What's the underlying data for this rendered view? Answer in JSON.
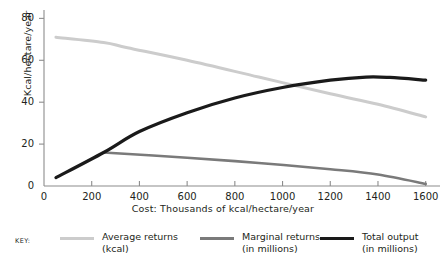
{
  "chart_data": {
    "type": "line",
    "title": "",
    "xlabel": "Cost:  Thousands of kcal/hectare/year",
    "ylabel": "Kcal/hectare/year",
    "xlim": [
      0,
      1660
    ],
    "ylim": [
      0,
      84
    ],
    "grid": false,
    "legend_position": "below",
    "xticks": [
      0,
      200,
      400,
      600,
      800,
      1000,
      1200,
      1400,
      1600
    ],
    "yticks": [
      0,
      20,
      40,
      60,
      80
    ],
    "series": [
      {
        "name": "Average returns (kcal)",
        "color": "#cccccc",
        "width": 3,
        "x": [
          50,
          250,
          350,
          600,
          900,
          1200,
          1400,
          1600
        ],
        "y": [
          71,
          68.5,
          66,
          60,
          52,
          44,
          39,
          33
        ]
      },
      {
        "name": "Marginal returns (in millions)",
        "color": "#7a7a7a",
        "width": 2.6,
        "x": [
          250,
          600,
          900,
          1200,
          1400,
          1600
        ],
        "y": [
          16,
          13.5,
          11,
          8,
          5.5,
          1
        ]
      },
      {
        "name": "Total output (in millions)",
        "color": "#1a1a1a",
        "width": 3.2,
        "x": [
          50,
          250,
          400,
          600,
          800,
          1000,
          1200,
          1350,
          1450,
          1600
        ],
        "y": [
          4,
          16,
          26,
          35,
          42,
          47,
          50.5,
          52,
          51.8,
          50.5
        ]
      }
    ]
  },
  "axes": {
    "ylabel": "Kcal/hectare/year",
    "xlabel": "Cost:  Thousands of kcal/hectare/year",
    "ytick_labels": [
      "0",
      "20",
      "40",
      "60",
      "80"
    ],
    "xtick_labels": [
      "0",
      "200",
      "400",
      "600",
      "800",
      "1000",
      "1200",
      "1400",
      "1600"
    ]
  },
  "legend": {
    "key_label": "KEY:",
    "entries": [
      {
        "line1": "Average returns",
        "line2": "(kcal)",
        "color": "#cccccc",
        "thickness": "3px"
      },
      {
        "line1": "Marginal returns",
        "line2": "(in millions)",
        "color": "#7a7a7a",
        "thickness": "2.6px"
      },
      {
        "line1": "Total output",
        "line2": "(in millions)",
        "color": "#1a1a1a",
        "thickness": "3.4px"
      }
    ]
  },
  "colors": {
    "axis": "#8c8c8c",
    "text": "#231f20",
    "average_returns": "#cccccc",
    "marginal_returns": "#7a7a7a",
    "total_output": "#1a1a1a"
  }
}
